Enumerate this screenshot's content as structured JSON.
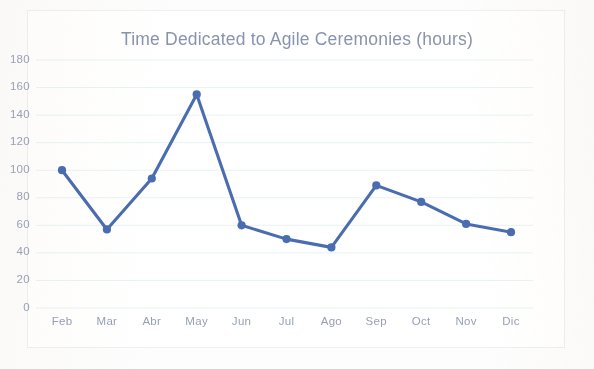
{
  "chart_data": {
    "type": "line",
    "title": "Time Dedicated to Agile Ceremonies (hours)",
    "xlabel": "",
    "ylabel": "",
    "categories": [
      "Feb",
      "Mar",
      "Abr",
      "May",
      "Jun",
      "Jul",
      "Ago",
      "Sep",
      "Oct",
      "Nov",
      "Dic"
    ],
    "values": [
      100,
      57,
      94,
      155,
      60,
      50,
      44,
      89,
      77,
      61,
      55
    ],
    "series": [
      {
        "name": "Hours",
        "values": [
          100,
          57,
          94,
          155,
          60,
          50,
          44,
          89,
          77,
          61,
          55
        ]
      }
    ],
    "ylim": [
      0,
      180
    ],
    "ytick_labels": [
      "180",
      "160",
      "140",
      "120",
      "100",
      "80",
      "60",
      "40",
      "20",
      "0"
    ],
    "ytick_values": [
      180,
      160,
      140,
      120,
      100,
      80,
      60,
      40,
      20,
      0
    ],
    "ytick_step": 20,
    "xtick_labels": [
      "Feb",
      "Mar",
      "Abr",
      "May",
      "Jun",
      "Jul",
      "Ago",
      "Sep",
      "Oct",
      "Nov",
      "Dic"
    ],
    "grid": "horizontal",
    "legend": "none",
    "markers": true,
    "colors": {
      "line": "#4a6cb0",
      "marker": "#4a6cb0",
      "title": "#8a93ad",
      "axis_label": "#99a2b7",
      "gridline": "#e8f2f4",
      "border": "#eceff3",
      "background": "#ffffff"
    }
  }
}
